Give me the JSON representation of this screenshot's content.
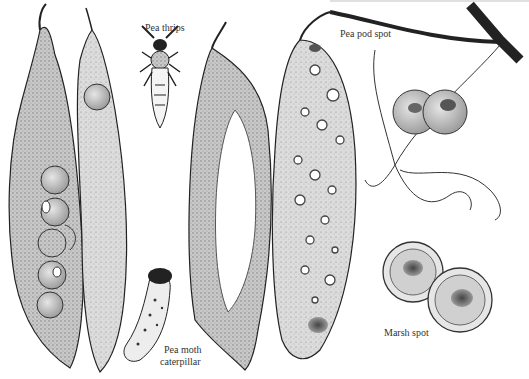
{
  "illustration": {
    "subject": "Pea pests and diseases",
    "labels": {
      "pea_thrips": "Pea thrips",
      "pea_moth_caterpillar_line1": "Pea moth",
      "pea_moth_caterpillar_line2": "caterpillar",
      "pea_pod_spot": "Pea pod spot",
      "marsh_spot": "Marsh spot"
    },
    "colors": {
      "ink": "#222222",
      "shade": "#9a9a9a",
      "light": "#d8d8d8",
      "paper": "#ffffff"
    }
  }
}
